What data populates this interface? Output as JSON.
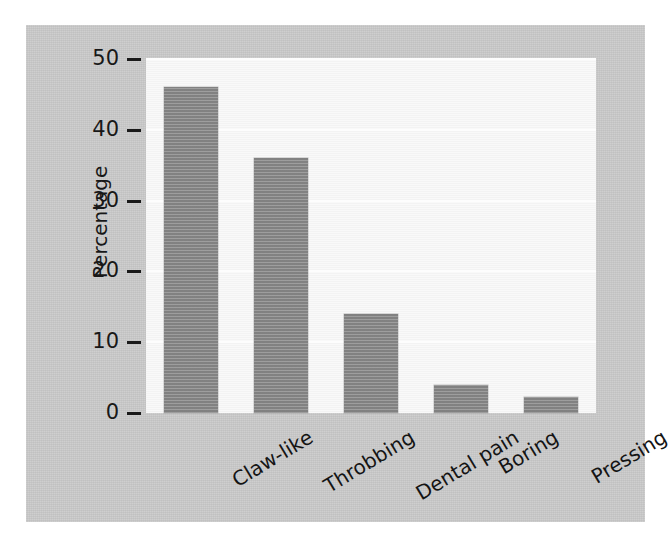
{
  "chart_data": {
    "type": "bar",
    "title": "",
    "subtitle": "",
    "xlabel": "",
    "ylabel": "Percentage",
    "categories": [
      "Claw-like",
      "Throbbing",
      "Dental pain",
      "Boring",
      "Pressing"
    ],
    "values": [
      46,
      36,
      14,
      4,
      2.3
    ],
    "series": [
      {
        "name": "Percentage",
        "values": [
          46,
          36,
          14,
          4,
          2.3
        ]
      }
    ],
    "ylim": [
      0,
      50
    ],
    "yticks": [
      0,
      10,
      20,
      30,
      40,
      50
    ],
    "ytick_labels": [
      "0",
      "10",
      "20",
      "30",
      "40",
      "50"
    ],
    "grid": "horizontal-faint",
    "legend": "none",
    "bar_color": "#8b8b8b",
    "plot_background": "#f6f6f6",
    "figure_background": "#c9c9c9",
    "xtick_label_rotation": "-31deg"
  }
}
